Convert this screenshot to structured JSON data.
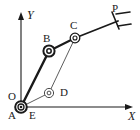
{
  "figure": {
    "type": "kinematic-linkage-diagram",
    "background_color": "#ffffff",
    "stroke_color": "#1a1a1a",
    "width": 140,
    "height": 130
  },
  "axes": {
    "x": {
      "label": "X",
      "origin": [
        21,
        107
      ],
      "end": [
        133,
        107
      ],
      "arrow": true
    },
    "y": {
      "label": "Y",
      "origin": [
        21,
        107
      ],
      "end": [
        21,
        12
      ],
      "arrow": true
    },
    "origin_label": "O"
  },
  "points": [
    {
      "name": "A",
      "label": "A",
      "x": 21,
      "y": 107,
      "joint": "double-circle",
      "label_dx": -11,
      "label_dy": 7
    },
    {
      "name": "E",
      "label": "E",
      "x": 21,
      "y": 107,
      "joint": "none",
      "label_dx": 9,
      "label_dy": 7
    },
    {
      "name": "O",
      "label": "O",
      "x": 21,
      "y": 107,
      "joint": "none",
      "label_dx": -12,
      "label_dy": -8
    },
    {
      "name": "B",
      "label": "B",
      "x": 49,
      "y": 51,
      "joint": "double-circle",
      "label_dx": -4,
      "label_dy": -11
    },
    {
      "name": "C",
      "label": "C",
      "x": 75,
      "y": 38,
      "joint": "double-circle",
      "label_dx": -3,
      "label_dy": -11
    },
    {
      "name": "D",
      "label": "D",
      "x": 49,
      "y": 93,
      "joint": "double-circle",
      "label_dx": 10,
      "label_dy": 2
    },
    {
      "name": "P",
      "label": "P",
      "x": 117,
      "y": 20,
      "joint": "gripper",
      "label_dx": -2,
      "label_dy": -11
    }
  ],
  "links": [
    {
      "name": "link-A-B",
      "from": "A",
      "to": "B",
      "weight": "thick"
    },
    {
      "name": "link-B-C",
      "from": "B",
      "to": "C",
      "weight": "thick"
    },
    {
      "name": "link-C-P",
      "from": "C",
      "to": "P",
      "weight": "thick"
    },
    {
      "name": "link-E-D",
      "from": "E",
      "to": "D",
      "weight": "thin"
    },
    {
      "name": "link-D-C",
      "from": "D",
      "to": "C",
      "weight": "thin"
    }
  ],
  "end_effector": {
    "name": "P",
    "symbol": "gripper",
    "tip": [
      117,
      20
    ]
  }
}
